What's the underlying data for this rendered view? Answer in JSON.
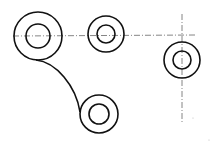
{
  "diagram": {
    "type": "technical-drawing",
    "colors": {
      "stroke": "#111111",
      "centerline": "#555555",
      "background": "#ffffff"
    },
    "circles": [
      {
        "id": "A",
        "cx": 38,
        "cy": 36,
        "outer_r": 24,
        "inner_r": 12
      },
      {
        "id": "B",
        "cx": 106,
        "cy": 34,
        "outer_r": 18,
        "inner_r": 9
      },
      {
        "id": "C",
        "cx": 182,
        "cy": 60,
        "outer_r": 18,
        "inner_r": 9
      },
      {
        "id": "D",
        "cx": 99,
        "cy": 114,
        "outer_r": 19,
        "inner_r": 10
      }
    ],
    "centerlines": [
      {
        "id": "horizontal-top",
        "x1": 13,
        "y1": 36,
        "x2": 196,
        "y2": 35
      },
      {
        "id": "vertical-right",
        "x1": 182,
        "y1": 14,
        "x2": 182,
        "y2": 124
      }
    ],
    "arcs": [
      {
        "id": "tangent-arc-A-D",
        "from": "A",
        "to": "D"
      }
    ]
  }
}
